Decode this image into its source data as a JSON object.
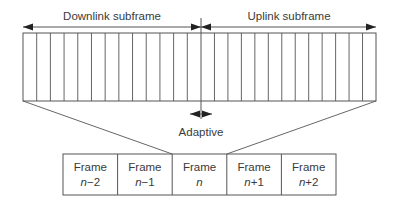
{
  "diagram": {
    "labels": {
      "downlink": "Downlink subframe",
      "uplink": "Uplink subframe",
      "adaptive": "Adaptive"
    },
    "slots": {
      "downlink_count": 13,
      "uplink_count": 13
    },
    "frames": [
      {
        "word": "Frame",
        "index": "n−2"
      },
      {
        "word": "Frame",
        "index": "n−1"
      },
      {
        "word": "Frame",
        "index": "n"
      },
      {
        "word": "Frame",
        "index": "n+1"
      },
      {
        "word": "Frame",
        "index": "n+2"
      }
    ],
    "expanded_frame_index": 2,
    "colors": {
      "line": "#555555",
      "text": "#3a3a3a"
    }
  }
}
